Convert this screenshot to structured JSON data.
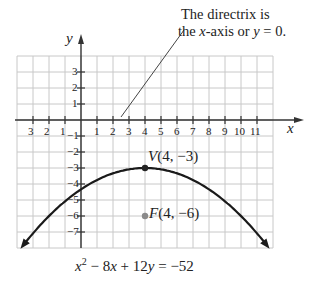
{
  "chart_data": {
    "type": "line",
    "title": "",
    "equation": "x² − 8x + 12y = −52",
    "xlabel": "x",
    "ylabel": "y",
    "xlim": [
      -4,
      12
    ],
    "ylim": [
      -8,
      4
    ],
    "grid": true,
    "x_ticks": [
      -3,
      -2,
      -1,
      1,
      2,
      3,
      4,
      5,
      6,
      7,
      8,
      9,
      10,
      11
    ],
    "x_tick_labels": [
      "3",
      "2",
      "1",
      "1",
      "2",
      "3",
      "4",
      "5",
      "6",
      "7",
      "8",
      "9",
      "10",
      "11"
    ],
    "y_ticks": [
      3,
      2,
      1,
      -1,
      -2,
      -3,
      -4,
      -5,
      -6,
      -7
    ],
    "y_tick_labels": [
      "3",
      "2",
      "1",
      "−1",
      "−2",
      "−3",
      "−4",
      "−5",
      "−6",
      "−7"
    ],
    "series": [
      {
        "name": "parabola",
        "function": "y = -(x-4)^2/12 - 3",
        "x": [
          -4,
          -2,
          0,
          2,
          4,
          6,
          8,
          10,
          12
        ],
        "y": [
          -8.33,
          -6.0,
          -4.33,
          -3.33,
          -3.0,
          -3.33,
          -4.33,
          -6.0,
          -8.33
        ],
        "color": "#1a1a1a",
        "arrows_at_ends": true
      }
    ],
    "points": [
      {
        "name": "vertex",
        "label": "V(4, −3)",
        "x": 4,
        "y": -3,
        "color": "#222222"
      },
      {
        "name": "focus",
        "label": "F(4, −6)",
        "x": 4,
        "y": -6,
        "color": "#8a8a8a"
      }
    ],
    "annotations": [
      {
        "text_line1": "The directrix is",
        "text_line2": "the x-axis or y = 0.",
        "points_to": [
          2.5,
          0
        ]
      }
    ]
  },
  "labels": {
    "axis_x": "x",
    "axis_y": "y",
    "vertex_letter": "V",
    "vertex_coords": "(4, −3)",
    "focus_letter": "F",
    "focus_coords": "(4, −6)",
    "callout_line1": "The directrix is",
    "callout_line2_pre": "the ",
    "callout_line2_x": "x",
    "callout_line2_mid": "-axis or ",
    "callout_line2_y": "y",
    "callout_line2_post": " = 0.",
    "equation_x": "x",
    "equation_sup": "2",
    "equation_rest1": " − 8",
    "equation_x2": "x",
    "equation_rest2": " + 12",
    "equation_y": "y",
    "equation_rest3": " = −52"
  },
  "colors": {
    "grid": "#c8c8c8",
    "axis": "#333333",
    "curve": "#1a1a1a",
    "vertex": "#222222",
    "focus": "#8a8a8a"
  }
}
